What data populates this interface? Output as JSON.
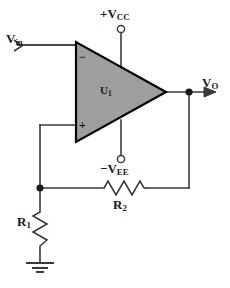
{
  "diagram": {
    "type": "schematic",
    "background_color": "#ffffff",
    "wire_color": "#3a3a3a",
    "opamp_fill_color": "#9e9e9e",
    "opamp_stroke_color": "#000000"
  },
  "labels": {
    "vin": {
      "symbol": "V",
      "subscript": "in",
      "prefix": ""
    },
    "vcc": {
      "symbol": "V",
      "subscript": "CC",
      "prefix": "+"
    },
    "vee": {
      "symbol": "V",
      "subscript": "EE",
      "prefix": "−"
    },
    "vo": {
      "symbol": "V",
      "subscript": "O",
      "prefix": ""
    },
    "u1": {
      "symbol": "U",
      "subscript": "1",
      "prefix": ""
    },
    "r1": {
      "symbol": "R",
      "subscript": "1",
      "prefix": ""
    },
    "r2": {
      "symbol": "R",
      "subscript": "2",
      "prefix": ""
    }
  },
  "opamp": {
    "designator": "U1",
    "inverting_input_sign": "−",
    "noninverting_input_sign": "+",
    "inverting_input_signal": "Vin",
    "noninverting_input_signal": "feedback node",
    "positive_supply": "+VCC",
    "negative_supply": "−VEE",
    "output_signal": "VO"
  },
  "components": [
    {
      "ref": "U1",
      "type": "op-amp",
      "name": "operational-amplifier"
    },
    {
      "ref": "R1",
      "type": "resistor",
      "name": "resistor-r1",
      "orientation": "vertical",
      "connects": [
        "feedback-node",
        "ground"
      ]
    },
    {
      "ref": "R2",
      "type": "resistor",
      "name": "resistor-r2",
      "orientation": "horizontal",
      "connects": [
        "feedback-node",
        "output-node"
      ]
    }
  ],
  "terminals": [
    {
      "name": "vcc-terminal",
      "style": "open-circle"
    },
    {
      "name": "vee-terminal",
      "style": "open-circle"
    },
    {
      "name": "vin-terminal",
      "style": "arrow-tail"
    },
    {
      "name": "vo-terminal",
      "style": "arrow-head"
    },
    {
      "name": "ground-terminal",
      "style": "earth-ground"
    }
  ],
  "junctions": [
    {
      "name": "output-node-dot"
    },
    {
      "name": "feedback-node-dot"
    }
  ]
}
